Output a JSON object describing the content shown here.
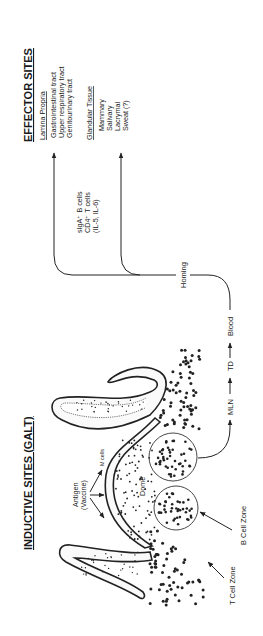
{
  "effector": {
    "title": "EFFECTOR SITES",
    "lamina_propria": {
      "heading": "Lamina Propria",
      "items": [
        "Gastrointestinal tract",
        "Upper respiratory tract",
        "Genitourinary tract"
      ]
    },
    "glandular_tissue": {
      "heading": "Glandular Tissue",
      "items": [
        "Mammary",
        "Salivary",
        "Lacrymal",
        "Sweat (?)"
      ]
    }
  },
  "cells": {
    "lines": [
      "sIgA⁺ B cells",
      "CD4⁺ T cells",
      "(IL-5, IL-6)"
    ]
  },
  "pathway": {
    "homing": "Homing",
    "steps": [
      "MLN",
      "TD",
      "Blood"
    ],
    "arrow": "arrow-right-icon"
  },
  "inductive": {
    "title": "INDUCTIVE SITES (GALT)",
    "antigen": [
      "Antigen",
      "(Vaccine)"
    ],
    "m_cells": "M cells",
    "dome": "Dome",
    "b_cell_zone": "B Cell Zone",
    "t_cell_zone": "T Cell Zone"
  }
}
